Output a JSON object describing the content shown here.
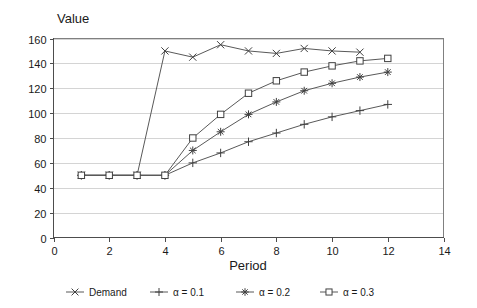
{
  "chart_data": {
    "type": "line",
    "title": "",
    "xlabel": "Period",
    "ylabel": "Value",
    "xlim": [
      0,
      14
    ],
    "ylim": [
      0,
      160
    ],
    "xticks": [
      0,
      2,
      4,
      6,
      8,
      10,
      12,
      14
    ],
    "yticks": [
      0,
      20,
      40,
      60,
      80,
      100,
      120,
      140,
      160
    ],
    "grid": "horizontal",
    "legend_position": "bottom",
    "series": [
      {
        "name": "Demand",
        "marker": "cross-x-icon",
        "x": [
          1,
          2,
          3,
          4,
          5,
          6,
          7,
          8,
          9,
          10,
          11
        ],
        "values": [
          50,
          50,
          50,
          150,
          145,
          155,
          150,
          148,
          152,
          150,
          149
        ]
      },
      {
        "name": "α = 0.1",
        "marker": "plus-icon",
        "x": [
          1,
          2,
          3,
          4,
          5,
          6,
          7,
          8,
          9,
          10,
          11,
          12
        ],
        "values": [
          50,
          50,
          50,
          50,
          60,
          68,
          77,
          84,
          91,
          97,
          102,
          107
        ]
      },
      {
        "name": "α = 0.2",
        "marker": "asterisk-icon",
        "x": [
          1,
          2,
          3,
          4,
          5,
          6,
          7,
          8,
          9,
          10,
          11,
          12
        ],
        "values": [
          50,
          50,
          50,
          50,
          70,
          85,
          99,
          109,
          118,
          124,
          129,
          133
        ]
      },
      {
        "name": "α = 0.3",
        "marker": "square-icon",
        "x": [
          1,
          2,
          3,
          4,
          5,
          6,
          7,
          8,
          9,
          10,
          11,
          12
        ],
        "values": [
          50,
          50,
          50,
          50,
          80,
          99,
          116,
          126,
          133,
          138,
          142,
          144
        ]
      }
    ],
    "series_end_values": {
      "Demand": 150,
      "alpha_0_1": 111,
      "alpha_0_2": 137,
      "alpha_0_3": 146
    },
    "colors": {
      "line": "#595959",
      "marker": "#404040",
      "grid": "#d4d4d4",
      "axis": "#4d4d4d",
      "border": "#808080",
      "background": "#ffffff",
      "text": "#1a1a1a"
    }
  },
  "axes": {
    "y_title": "Value",
    "x_title": "Period",
    "y_tick_labels": [
      "0",
      "20",
      "40",
      "60",
      "80",
      "100",
      "120",
      "140",
      "160"
    ],
    "x_tick_labels": [
      "0",
      "2",
      "4",
      "6",
      "8",
      "10",
      "12",
      "14"
    ]
  },
  "legend": {
    "items": [
      {
        "label": "Demand",
        "marker": "cross-x-icon"
      },
      {
        "label": "α = 0.1",
        "marker": "plus-icon"
      },
      {
        "label": "α = 0.2",
        "marker": "asterisk-icon"
      },
      {
        "label": "α = 0.3",
        "marker": "square-icon"
      }
    ]
  }
}
